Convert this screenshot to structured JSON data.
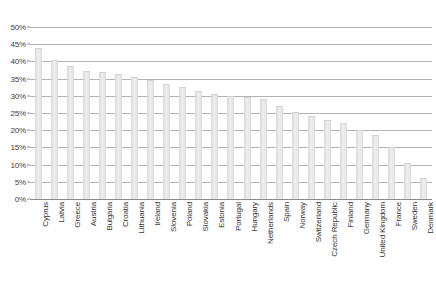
{
  "chart_data": {
    "type": "bar",
    "title": "",
    "subtitle": "",
    "xlabel": "",
    "ylabel": "",
    "ylim": [
      0,
      50
    ],
    "ytick_labels": [
      "50%",
      "45%",
      "40%",
      "35%",
      "30%",
      "25%",
      "20%",
      "15%",
      "10%",
      "5%",
      "0%"
    ],
    "ytick_values": [
      50,
      45,
      40,
      35,
      30,
      25,
      20,
      15,
      10,
      5,
      0
    ],
    "grid": true,
    "legend": false,
    "value_suffix": "%",
    "categories": [
      "Cyprus",
      "Latvia",
      "Greece",
      "Austria",
      "Bulgaria",
      "Croatia",
      "Lithuania",
      "Ireland",
      "Slovenia",
      "Poland",
      "Slovakia",
      "Estonia",
      "Portugal",
      "Hungary",
      "Netherlands",
      "Spain",
      "Norway",
      "Switzerland",
      "Czech Republic",
      "Finland",
      "Germany",
      "United Kingdom",
      "France",
      "Sweden",
      "Denmark"
    ],
    "values": [
      44.0,
      40.5,
      38.7,
      37.3,
      37.0,
      36.2,
      35.5,
      34.5,
      33.5,
      32.5,
      31.5,
      30.6,
      30.0,
      29.6,
      29.2,
      27.0,
      25.2,
      24.0,
      23.0,
      22.2,
      20.0,
      18.5,
      15.0,
      10.5,
      6.0
    ]
  }
}
